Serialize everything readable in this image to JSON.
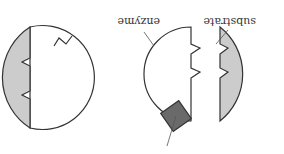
{
  "diagram": {
    "orientation": "rotated 180 degrees",
    "labels": {
      "substrate": "substrate",
      "enzyme": "enzyme"
    },
    "colors": {
      "outline": "#333333",
      "substrate_fill": "#cccccc",
      "inhibitor_fill": "#6a6a6a",
      "background": "#ffffff"
    },
    "panels": [
      {
        "name": "enzyme-with-substrate-and-inhibitor",
        "shapes": [
          "enzyme",
          "substrate",
          "allosteric-inhibitor"
        ]
      },
      {
        "name": "enzyme-with-substrate-bound",
        "shapes": [
          "enzyme",
          "substrate"
        ]
      }
    ]
  }
}
